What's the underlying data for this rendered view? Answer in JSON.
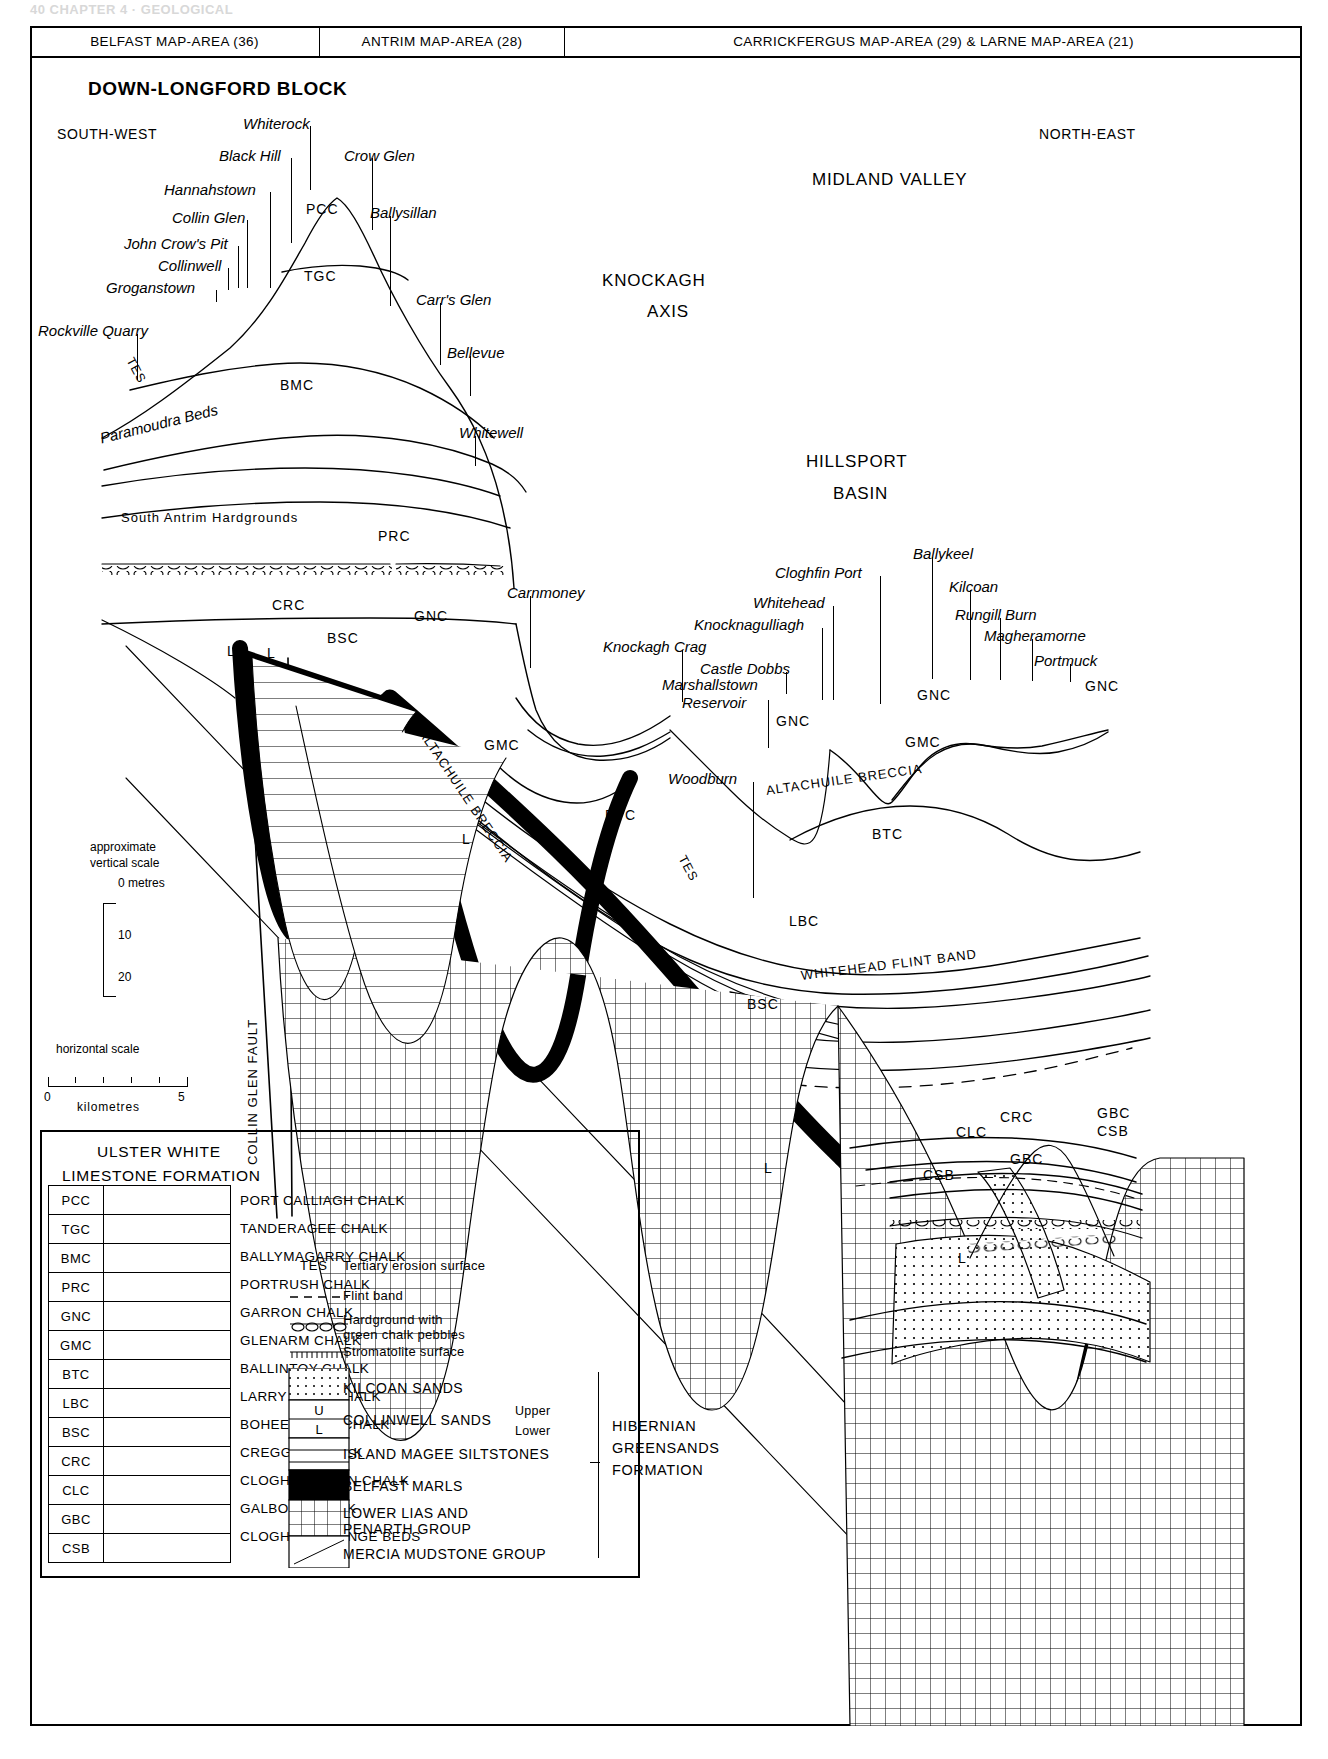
{
  "running_head": "40   CHAPTER 4 · GEOLOGICAL",
  "map_header": {
    "cells": [
      "BELFAST MAP-AREA (36)",
      "ANTRIM MAP-AREA (28)",
      "CARRICKFERGUS MAP-AREA (29) & LARNE MAP-AREA (21)"
    ]
  },
  "regions": {
    "block": "DOWN-LONGFORD BLOCK",
    "midland_valley": "MIDLAND VALLEY",
    "knockagh_axis_1": "KNOCKAGH",
    "knockagh_axis_2": "AXIS",
    "hillsport_1": "HILLSPORT",
    "hillsport_2": "BASIN",
    "south_west": "SOUTH-WEST",
    "north_east": "NORTH-EAST"
  },
  "localities": [
    {
      "name": "Whiterock",
      "x": 243,
      "y": 115,
      "lead_x": 310,
      "lead_y": 126,
      "lead_h": 64
    },
    {
      "name": "Black Hill",
      "x": 219,
      "y": 147,
      "lead_x": 291,
      "lead_y": 158,
      "lead_h": 85
    },
    {
      "name": "Crow Glen",
      "x": 344,
      "y": 147,
      "lead_x": 372,
      "lead_y": 158,
      "lead_h": 72
    },
    {
      "name": "Hannahstown",
      "x": 164,
      "y": 181,
      "lead_x": 270,
      "lead_y": 192,
      "lead_h": 96
    },
    {
      "name": "Collin Glen",
      "x": 172,
      "y": 209,
      "lead_x": 247,
      "lead_y": 220,
      "lead_h": 68
    },
    {
      "name": "Ballysillan",
      "x": 370,
      "y": 204,
      "lead_x": 390,
      "lead_y": 216,
      "lead_h": 90
    },
    {
      "name": "John Crow's Pit",
      "x": 124,
      "y": 235,
      "lead_x": 238,
      "lead_y": 246,
      "lead_h": 42
    },
    {
      "name": "Collinwell",
      "x": 158,
      "y": 257,
      "lead_x": 228,
      "lead_y": 268,
      "lead_h": 22
    },
    {
      "name": "Groganstown",
      "x": 106,
      "y": 279,
      "lead_x": 216,
      "lead_y": 290,
      "lead_h": 12
    },
    {
      "name": "Carr's Glen",
      "x": 416,
      "y": 291,
      "lead_x": 440,
      "lead_y": 303,
      "lead_h": 62
    },
    {
      "name": "Rockville Quarry",
      "x": 38,
      "y": 322,
      "lead_x": 137,
      "lead_y": 334,
      "lead_h": 46
    },
    {
      "name": "Bellevue",
      "x": 447,
      "y": 344,
      "lead_x": 470,
      "lead_y": 356,
      "lead_h": 40
    },
    {
      "name": "Paramoudra Beds",
      "x": 98,
      "y": 430,
      "rot": -14
    },
    {
      "name": "Whitewell",
      "x": 459,
      "y": 424,
      "lead_x": 475,
      "lead_y": 436,
      "lead_h": 30
    },
    {
      "name": "Carnmoney",
      "x": 507,
      "y": 584,
      "lead_x": 530,
      "lead_y": 596,
      "lead_h": 72
    },
    {
      "name": "Knockagh Crag",
      "x": 603,
      "y": 638,
      "lead_x": 682,
      "lead_y": 650,
      "lead_h": 52
    },
    {
      "name": "Castle Dobbs",
      "x": 700,
      "y": 660,
      "lead_x": 786,
      "lead_y": 672,
      "lead_h": 22
    },
    {
      "name": "Knocknagulliagh",
      "x": 694,
      "y": 616,
      "lead_x": 822,
      "lead_y": 628,
      "lead_h": 72
    },
    {
      "name": "Whitehead",
      "x": 753,
      "y": 594,
      "lead_x": 833,
      "lead_y": 606,
      "lead_h": 94
    },
    {
      "name": "Cloghfin Port",
      "x": 775,
      "y": 564,
      "lead_x": 880,
      "lead_y": 576,
      "lead_h": 128
    },
    {
      "name": "Marshallstown",
      "x": 662,
      "y": 676,
      "lead_x": 768,
      "lead_y": 700,
      "lead_h": 48
    },
    {
      "name": "Reservoir",
      "x": 682,
      "y": 694
    },
    {
      "name": "Woodburn",
      "x": 668,
      "y": 770,
      "lead_x": 753,
      "lead_y": 782,
      "lead_h": 116
    },
    {
      "name": "Ballykeel",
      "x": 913,
      "y": 545,
      "lead_x": 932,
      "lead_y": 557,
      "lead_h": 122
    },
    {
      "name": "Kilcoan",
      "x": 949,
      "y": 578,
      "lead_x": 970,
      "lead_y": 590,
      "lead_h": 90
    },
    {
      "name": "Rungill Burn",
      "x": 955,
      "y": 606,
      "lead_x": 1000,
      "lead_y": 618,
      "lead_h": 62
    },
    {
      "name": "Magheramorne",
      "x": 984,
      "y": 627,
      "lead_x": 1032,
      "lead_y": 639,
      "lead_h": 42
    },
    {
      "name": "Portmuck",
      "x": 1034,
      "y": 652,
      "lead_x": 1070,
      "lead_y": 664,
      "lead_h": 18
    }
  ],
  "section_codes": [
    {
      "code": "PCC",
      "x": 306,
      "y": 201
    },
    {
      "code": "TGC",
      "x": 304,
      "y": 268
    },
    {
      "code": "BMC",
      "x": 280,
      "y": 377
    },
    {
      "code": "PRC",
      "x": 378,
      "y": 528
    },
    {
      "code": "GNC",
      "x": 414,
      "y": 608
    },
    {
      "code": "CRC",
      "x": 272,
      "y": 597
    },
    {
      "code": "BSC",
      "x": 327,
      "y": 630
    },
    {
      "code": "L",
      "x": 227,
      "y": 643
    },
    {
      "code": "L",
      "x": 267,
      "y": 645
    },
    {
      "code": "U",
      "x": 239,
      "y": 660
    },
    {
      "code": "GMC",
      "x": 484,
      "y": 737
    },
    {
      "code": "BTC",
      "x": 605,
      "y": 807
    },
    {
      "code": "GNC",
      "x": 776,
      "y": 713
    },
    {
      "code": "GNC",
      "x": 917,
      "y": 687
    },
    {
      "code": "GNC",
      "x": 1085,
      "y": 678
    },
    {
      "code": "GMC",
      "x": 905,
      "y": 734
    },
    {
      "code": "BTC",
      "x": 872,
      "y": 826
    },
    {
      "code": "LBC",
      "x": 789,
      "y": 913
    },
    {
      "code": "BSC",
      "x": 747,
      "y": 996
    },
    {
      "code": "CRC",
      "x": 1000,
      "y": 1109
    },
    {
      "code": "CLC",
      "x": 956,
      "y": 1124
    },
    {
      "code": "GBC",
      "x": 1010,
      "y": 1151
    },
    {
      "code": "GBC",
      "x": 1097,
      "y": 1105
    },
    {
      "code": "CSB",
      "x": 1097,
      "y": 1123
    },
    {
      "code": "CSB",
      "x": 923,
      "y": 1167
    },
    {
      "code": "L",
      "x": 764,
      "y": 1160
    },
    {
      "code": "L",
      "x": 462,
      "y": 831
    },
    {
      "code": "L",
      "x": 958,
      "y": 1250
    }
  ],
  "surface_labels": [
    {
      "text": "TES",
      "x": 136,
      "y": 355,
      "rot": 62
    },
    {
      "text": "TES",
      "x": 688,
      "y": 853,
      "rot": 62
    },
    {
      "text": "South Antrim Hardgrounds",
      "x": 121,
      "y": 510
    },
    {
      "text": "ALTACHUILE BRECCIA",
      "x": 428,
      "y": 726,
      "rot": 56
    },
    {
      "text": "ALTACHUILE BRECCIA",
      "x": 765,
      "y": 783,
      "rot": -8
    },
    {
      "text": "WHITEHEAD FLINT BAND",
      "x": 800,
      "y": 968,
      "rot": -7
    },
    {
      "text": "COLLIN GLEN FAULT",
      "x": 245,
      "y": 1165,
      "rot": -90
    }
  ],
  "vertical_scale": {
    "caption_1": "approximate",
    "caption_2": "vertical scale",
    "ticks": [
      "0 metres",
      "10",
      "20"
    ]
  },
  "horizontal_scale": {
    "caption": "horizontal scale",
    "unit": "kilometres",
    "min": "0",
    "max": "5"
  },
  "legend": {
    "formation_title_1": "ULSTER WHITE",
    "formation_title_2": "LIMESTONE FORMATION",
    "codes": [
      {
        "code": "PCC",
        "label": "PORT CALLIAGH CHALK"
      },
      {
        "code": "TGC",
        "label": "TANDERAGEE CHALK"
      },
      {
        "code": "BMC",
        "label": "BALLYMAGARRY CHALK"
      },
      {
        "code": "PRC",
        "label": "PORTRUSH CHALK"
      },
      {
        "code": "GNC",
        "label": "GARRON CHALK"
      },
      {
        "code": "GMC",
        "label": "GLENARM CHALK"
      },
      {
        "code": "BTC",
        "label": "BALLINTOY CHALK"
      },
      {
        "code": "LBC",
        "label": "LARRY BANE CHALK"
      },
      {
        "code": "BSC",
        "label": "BOHEESHANE CHALK"
      },
      {
        "code": "CRC",
        "label": "CREGGAN CHALK"
      },
      {
        "code": "CLC",
        "label": "CLOGHASTUCAN CHALK"
      },
      {
        "code": "GBC",
        "label": "GALBOLY CHALK"
      },
      {
        "code": "CSB",
        "label": "CLOGHFIN SPONGE BEDS"
      }
    ],
    "symbols": [
      {
        "key": "TES",
        "label": "Tertiary erosion surface",
        "kind": "text"
      },
      {
        "key": "flint",
        "label": "Flint band",
        "kind": "dashed"
      },
      {
        "key": "hardground",
        "label_1": "Hardground with",
        "label_2": "green chalk pebbles",
        "kind": "hardground"
      },
      {
        "key": "stromatolite",
        "label": "Stromatolite surface",
        "kind": "stromatolite"
      }
    ],
    "units": [
      {
        "label": "KILCOAN SANDS",
        "kind": "dots"
      },
      {
        "label": "COLLINWELL SANDS",
        "sub_1": "Upper",
        "sub_2": "Lower",
        "kind": "ul",
        "u": "U",
        "l": "L"
      },
      {
        "label": "ISLAND MAGEE SILTSTONES",
        "kind": "lines"
      },
      {
        "label": "BELFAST MARLS",
        "kind": "solid"
      },
      {
        "label_1": "LOWER LIAS AND",
        "label_2": "PENARTH GROUP",
        "kind": "grid"
      },
      {
        "label": "MERCIA MUDSTONE GROUP",
        "kind": "diag"
      }
    ],
    "group_title_1": "HIBERNIAN",
    "group_title_2": "GREENSANDS",
    "group_title_3": "FORMATION"
  },
  "colors": {
    "ink": "#000000",
    "paper": "#ffffff",
    "rule": "#000000"
  }
}
